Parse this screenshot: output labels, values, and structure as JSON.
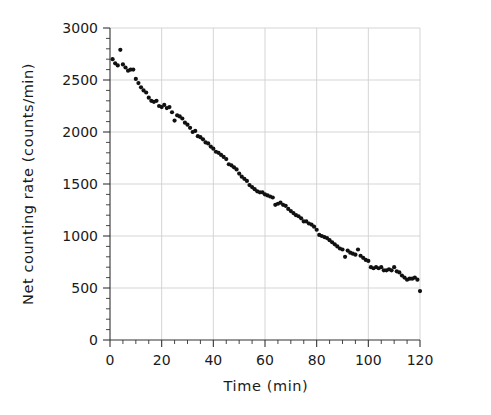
{
  "figure": {
    "background_color": "#ffffff",
    "point_color": "#111111",
    "grid_color": "#d0d0d0",
    "axis_color": "#333333"
  },
  "chart_data": {
    "type": "scatter",
    "title": "",
    "xlabel": "Time (min)",
    "ylabel": "Net counting rate (counts/min)",
    "xlim": [
      0,
      120
    ],
    "ylim": [
      0,
      3000
    ],
    "xticks": [
      0,
      20,
      40,
      60,
      80,
      100,
      120
    ],
    "xtick_labels": [
      "0",
      "20",
      "40",
      "60",
      "80",
      "100",
      "120"
    ],
    "yticks": [
      0,
      500,
      1000,
      1500,
      2000,
      2500,
      3000
    ],
    "ytick_labels": [
      "0",
      "500",
      "1000",
      "1500",
      "2000",
      "2500",
      "3000"
    ],
    "x_minor_tick_interval": 5,
    "y_minor_tick_interval": 100,
    "grid": true,
    "grid_axes": "both",
    "legend": false,
    "legend_position": "none",
    "marker": "circle",
    "marker_size": 3,
    "series": [
      {
        "name": "Net counting rate",
        "x": [
          1,
          2,
          3,
          4,
          5,
          6,
          7,
          8,
          9,
          10,
          11,
          12,
          13,
          14,
          15,
          16,
          17,
          18,
          19,
          20,
          21,
          22,
          23,
          24,
          25,
          26,
          27,
          28,
          29,
          30,
          31,
          32,
          33,
          34,
          35,
          36,
          37,
          38,
          39,
          40,
          41,
          42,
          43,
          44,
          45,
          46,
          47,
          48,
          49,
          50,
          51,
          52,
          53,
          54,
          55,
          56,
          57,
          58,
          59,
          60,
          61,
          62,
          63,
          64,
          65,
          66,
          67,
          68,
          69,
          70,
          71,
          72,
          73,
          74,
          75,
          76,
          77,
          78,
          79,
          80,
          81,
          82,
          83,
          84,
          85,
          86,
          87,
          88,
          89,
          90,
          91,
          92,
          93,
          94,
          95,
          96,
          97,
          98,
          99,
          100,
          101,
          102,
          103,
          104,
          105,
          106,
          107,
          108,
          109,
          110,
          111,
          112,
          113,
          114,
          115,
          116,
          117,
          118,
          119,
          120
        ],
        "y": [
          2700,
          2660,
          2640,
          2790,
          2650,
          2620,
          2590,
          2600,
          2600,
          2510,
          2470,
          2430,
          2400,
          2380,
          2330,
          2300,
          2290,
          2300,
          2250,
          2240,
          2260,
          2230,
          2240,
          2190,
          2110,
          2160,
          2150,
          2130,
          2090,
          2070,
          2040,
          2000,
          2010,
          1960,
          1950,
          1930,
          1900,
          1890,
          1860,
          1840,
          1810,
          1800,
          1780,
          1760,
          1740,
          1690,
          1680,
          1660,
          1640,
          1600,
          1570,
          1550,
          1530,
          1490,
          1470,
          1450,
          1430,
          1420,
          1420,
          1400,
          1390,
          1380,
          1370,
          1300,
          1310,
          1320,
          1300,
          1290,
          1260,
          1240,
          1220,
          1200,
          1190,
          1170,
          1140,
          1140,
          1120,
          1110,
          1090,
          1060,
          1010,
          1000,
          990,
          980,
          960,
          940,
          920,
          900,
          880,
          870,
          800,
          860,
          840,
          830,
          820,
          870,
          810,
          790,
          770,
          760,
          700,
          690,
          700,
          690,
          700,
          670,
          670,
          680,
          670,
          700,
          660,
          650,
          620,
          600,
          580,
          590,
          590,
          600,
          580,
          470
        ]
      }
    ]
  },
  "axis_label_x": "Time (min)",
  "axis_label_y": "Net counting rate (counts/min)"
}
